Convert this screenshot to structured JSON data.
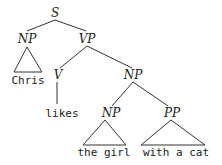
{
  "tree": {
    "root": "S",
    "nodes": {
      "s": "S",
      "np_subject": "NP",
      "vp": "VP",
      "v": "V",
      "np_object": "NP",
      "np_inner": "NP",
      "pp": "PP"
    },
    "words": {
      "subject": "Chris",
      "verb": "likes",
      "object": "the girl",
      "pp_phrase": "with a cat"
    }
  }
}
